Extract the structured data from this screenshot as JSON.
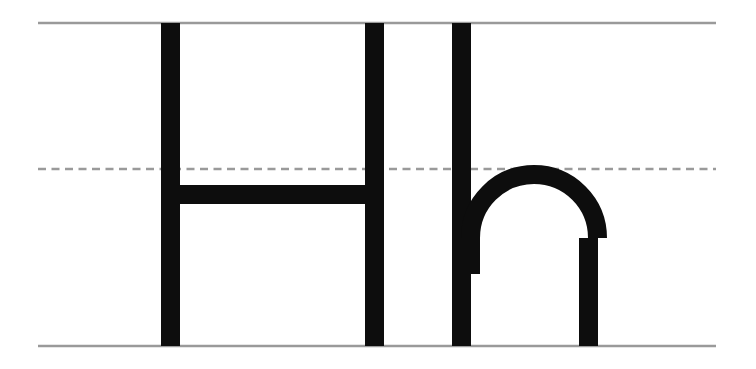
{
  "worksheet": {
    "title": "Handwriting Practice Letter Hh",
    "letters_shown": "Hh",
    "uppercase_letter": "H",
    "lowercase_letter": "h",
    "background_color": "#ffffff",
    "letter_color": "#0d0d0d",
    "rule_color": "#9a9a9a",
    "canvas": {
      "width": 756,
      "height": 369
    }
  },
  "guide_lines": {
    "x_start": 38,
    "x_end": 716,
    "top_line": {
      "name": "top-line",
      "label": "Top line",
      "y": 23,
      "style": "solid"
    },
    "mid_line": {
      "name": "mid-line",
      "label": "Dashed midline",
      "y": 169,
      "style": "dashed",
      "dash_length": 8,
      "dash_gap": 5.5
    },
    "base_line": {
      "name": "base-line",
      "label": "Baseline",
      "y": 346,
      "style": "solid"
    }
  },
  "glyphs": {
    "uppercase_h": {
      "label": "H",
      "stroke_width": 19,
      "left_stem": {
        "x": 161,
        "y_top": 23,
        "y_bottom": 346
      },
      "right_stem": {
        "x": 365,
        "y_top": 23,
        "y_bottom": 346
      },
      "crossbar": {
        "x_start": 161,
        "x_end": 384,
        "y_top": 185,
        "y_bottom": 204
      }
    },
    "lowercase_h": {
      "label": "h",
      "stroke_width": 19,
      "stem": {
        "x": 452,
        "y_top": 23,
        "y_bottom": 346
      },
      "arch": {
        "center_x": 534,
        "center_y": 239,
        "outer_radius": 73,
        "top_y": 165,
        "right_leg_x_start": 579,
        "right_leg_x_end": 598,
        "right_leg_y_bottom": 346
      }
    }
  }
}
